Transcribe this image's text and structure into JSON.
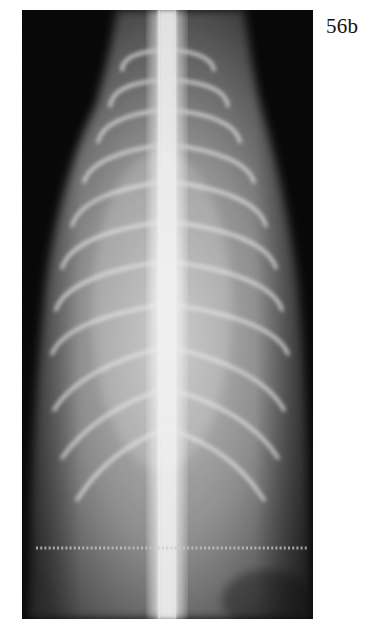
{
  "figure": {
    "label": "56b",
    "colors": {
      "background": "#000000",
      "bone": "#f2f2f2",
      "soft_tissue": "#8a8a8a",
      "page": "#ffffff",
      "label_text": "#111111"
    }
  }
}
